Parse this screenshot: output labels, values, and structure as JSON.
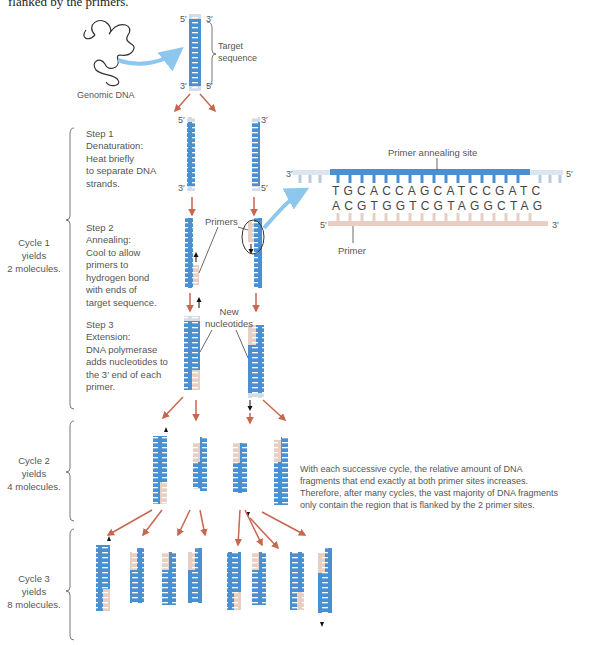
{
  "header_fragment": "flanked by the primers.",
  "top": {
    "genomic_label": "Genomic DNA",
    "target_label": "Target\nsequence",
    "end_labels": {
      "tl": "5′",
      "tr": "3′",
      "bl": "3′",
      "br": "5′"
    }
  },
  "cycle1": {
    "label": "Cycle 1\nyields\n2 molecules.",
    "step1": {
      "title": "Step 1",
      "text": "Denaturation:\nHeat briefly\nto separate DNA\nstrands.",
      "end_labels": {
        "l_top": "5′",
        "l_bot": "3′",
        "r_top": "3′",
        "r_bot": "5′"
      }
    },
    "step2": {
      "title": "Step 2",
      "text": "Annealing:\nCool to allow\nprimers to\nhydrogen bond\nwith ends of\ntarget sequence.",
      "primers_label": "Primers"
    },
    "step3": {
      "title": "Step 3",
      "text": "Extension:\nDNA polymerase\nadds nucleotides to\nthe 3′ end of each\nprimer.",
      "new_nucleotides_label": "New\nnucleotides"
    }
  },
  "inset": {
    "title": "Primer annealing site",
    "top_strand_left": "3′",
    "top_strand_right": "5′",
    "top_sequence": "TGCACCAGCATCCGATC",
    "bottom_sequence": "ACGTGGTCGTAGGCTAG",
    "bottom_strand_left": "5′",
    "bottom_strand_right": "3′",
    "primer_label": "Primer"
  },
  "cycle2": {
    "label": "Cycle 2\nyields\n4 molecules.",
    "note": "With each successive cycle, the relative amount of DNA fragments that end exactly at both primer sites increases. Therefore, after many cycles, the vast majority of DNA fragments only contain the region that is flanked by the 2 primer sites."
  },
  "cycle3": {
    "label": "Cycle 3\nyields\n8 molecules."
  },
  "colors": {
    "dna_blue": "#4a90d0",
    "primer_pink": "#e8cfc4",
    "arrow": "#c8664e",
    "bracket": "#777777",
    "text": "#555555"
  }
}
